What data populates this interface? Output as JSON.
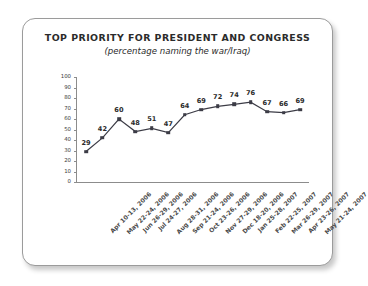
{
  "card": {
    "title": "TOP PRIORITY FOR PRESIDENT AND CONGRESS",
    "subtitle": "(percentage naming the war/Iraq)"
  },
  "chart_data": {
    "type": "line",
    "title": "TOP PRIORITY FOR PRESIDENT AND CONGRESS",
    "subtitle": "(percentage naming the war/Iraq)",
    "xlabel": "",
    "ylabel": "",
    "ylim": [
      0,
      100
    ],
    "ytick_step": 10,
    "yticks": [
      100,
      90,
      80,
      70,
      60,
      50,
      40,
      30,
      20,
      10,
      0
    ],
    "grid": false,
    "legend": false,
    "line_color": "#3c3c46",
    "marker": "square",
    "marker_color": "#3c3c46",
    "show_value_labels": true,
    "categories": [
      "Apr 10-13, 2006",
      "May 22-24, 2006",
      "Jun 26-29, 2006",
      "Jul 24-27, 2006",
      "Aug 28-31, 2006",
      "Sep 21-24, 2006",
      "Oct 23-26, 2006",
      "Nov 27-29, 2006",
      "Dec 18-20, 2006",
      "Jan 25-28, 2007",
      "Feb 22-25, 2007",
      "Mar 26-29, 2007",
      "Apr 23-26, 2007",
      "May 21-24, 2007"
    ],
    "values": [
      29,
      42,
      60,
      48,
      51,
      47,
      64,
      69,
      72,
      74,
      76,
      67,
      66,
      69
    ]
  }
}
